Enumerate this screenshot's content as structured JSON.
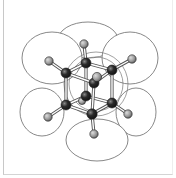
{
  "diagram": {
    "title": "",
    "colors": {
      "dark_atom": "#1e1e1e",
      "dark_atom_highlight": "#8a8a8a",
      "light_atom": "#9a9a9a",
      "light_atom_highlight": "#dcdcdc",
      "lobe_stroke": "#6a6a6a",
      "frame": "#c8c8c8"
    },
    "lobes": [
      {
        "cx": 88,
        "cy": 40,
        "rx": 30,
        "ry": 18
      },
      {
        "cx": 52,
        "cy": 58,
        "rx": 30,
        "ry": 26
      },
      {
        "cx": 130,
        "cy": 58,
        "rx": 28,
        "ry": 26
      },
      {
        "cx": 42,
        "cy": 112,
        "rx": 22,
        "ry": 24
      },
      {
        "cx": 136,
        "cy": 112,
        "rx": 20,
        "ry": 24
      },
      {
        "cx": 97,
        "cy": 140,
        "rx": 31,
        "ry": 21
      }
    ],
    "rings": [
      {
        "cx": 96,
        "cy": 84,
        "r": 32
      },
      {
        "cx": 96,
        "cy": 84,
        "r": 27
      }
    ],
    "bonds": [
      [
        86,
        63,
        66,
        73
      ],
      [
        86,
        63,
        112,
        70
      ],
      [
        86,
        63,
        84,
        44
      ],
      [
        66,
        73,
        49,
        61
      ],
      [
        112,
        70,
        132,
        59
      ],
      [
        66,
        73,
        66,
        105
      ],
      [
        112,
        70,
        112,
        103
      ],
      [
        86,
        63,
        86,
        96
      ],
      [
        66,
        105,
        92,
        114
      ],
      [
        112,
        103,
        92,
        114
      ],
      [
        86,
        96,
        66,
        105
      ],
      [
        86,
        96,
        112,
        103
      ],
      [
        66,
        73,
        94,
        83
      ],
      [
        112,
        70,
        94,
        83
      ],
      [
        92,
        114,
        94,
        83
      ],
      [
        92,
        114,
        94,
        134
      ],
      [
        66,
        105,
        48,
        117
      ],
      [
        112,
        103,
        128,
        114
      ]
    ],
    "atoms": [
      {
        "type": "light",
        "x": 84,
        "y": 44,
        "r": 4.2
      },
      {
        "type": "light",
        "x": 49,
        "y": 61,
        "r": 4.2
      },
      {
        "type": "light",
        "x": 132,
        "y": 59,
        "r": 4.2
      },
      {
        "type": "light",
        "x": 82,
        "y": 101,
        "r": 3.6
      },
      {
        "type": "dark",
        "x": 86,
        "y": 63,
        "r": 5
      },
      {
        "type": "dark",
        "x": 66,
        "y": 73,
        "r": 5
      },
      {
        "type": "dark",
        "x": 112,
        "y": 70,
        "r": 5
      },
      {
        "type": "dark",
        "x": 86,
        "y": 96,
        "r": 5
      },
      {
        "type": "dark",
        "x": 94,
        "y": 83,
        "r": 5
      },
      {
        "type": "light",
        "x": 97,
        "y": 77,
        "r": 4.6
      },
      {
        "type": "dark",
        "x": 66,
        "y": 105,
        "r": 5
      },
      {
        "type": "dark",
        "x": 112,
        "y": 103,
        "r": 5
      },
      {
        "type": "dark",
        "x": 92,
        "y": 114,
        "r": 5.2
      },
      {
        "type": "light",
        "x": 48,
        "y": 117,
        "r": 4.2
      },
      {
        "type": "light",
        "x": 128,
        "y": 114,
        "r": 4.2
      },
      {
        "type": "light",
        "x": 94,
        "y": 134,
        "r": 4.2
      }
    ]
  }
}
